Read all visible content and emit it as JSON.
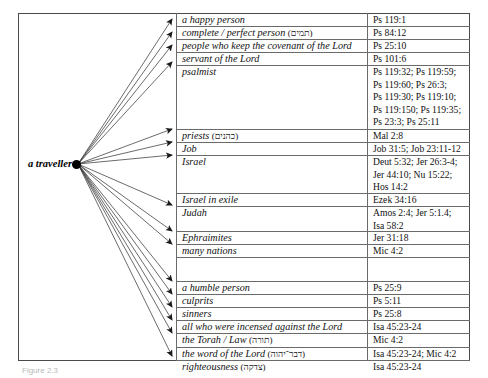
{
  "figure": {
    "hub_label": "a traveller",
    "caption": "Figure 2.3",
    "accent_color": "#000000",
    "border_color": "#4a4a4a",
    "grid_color": "#6a6a6a"
  },
  "rows": [
    {
      "label": "a happy person",
      "hebrew": "",
      "ref": "Ps 119:1",
      "y": 1,
      "h": 13,
      "arrow": true
    },
    {
      "label": "complete / perfect person",
      "hebrew": "(תמים)",
      "ref": "Ps 84:12",
      "y": 14,
      "h": 13,
      "arrow": true
    },
    {
      "label": "people who keep the covenant of the Lord",
      "hebrew": "",
      "ref": "Ps 25:10",
      "y": 27,
      "h": 13,
      "arrow": true
    },
    {
      "label": "servant of the Lord",
      "hebrew": "",
      "ref": "Ps 101:6",
      "y": 40,
      "h": 13,
      "arrow": false
    },
    {
      "label": "psalmist",
      "hebrew": "",
      "ref": "Ps 119:32; Ps 119:59;\nPs 119:60; Ps 26:3;\nPs 119:30; Ps 119:10;\nPs 119:150; Ps 119:35;\nPs 23:3; Ps 25:11",
      "y": 53,
      "h": 64,
      "arrow": true
    },
    {
      "label": "priests",
      "hebrew": "(כהנים)",
      "ref": "Mal 2:8",
      "y": 117,
      "h": 13,
      "arrow": true
    },
    {
      "label": "Job",
      "hebrew": "",
      "ref": "Job 31:5; Job 23:11-12",
      "y": 130,
      "h": 13,
      "arrow": true
    },
    {
      "label": "Israel",
      "hebrew": "",
      "ref": "Deut 5:32; Jer 26:3-4;\nJer 44:10; Nu 15:22;\nHos 14:2",
      "y": 143,
      "h": 38,
      "arrow": true
    },
    {
      "label": "Israel in exile",
      "hebrew": "",
      "ref": "Ezek 34:16",
      "y": 181,
      "h": 13,
      "arrow": false
    },
    {
      "label": "Judah",
      "hebrew": "",
      "ref": "Amos 2:4; Jer 5:1.4;\nIsa 58:2",
      "y": 194,
      "h": 25,
      "arrow": true
    },
    {
      "label": "Ephraimites",
      "hebrew": "",
      "ref": "Jer 31:18",
      "y": 219,
      "h": 13,
      "arrow": true
    },
    {
      "label": "many nations",
      "hebrew": "",
      "ref": "Mic 4:2",
      "y": 232,
      "h": 13,
      "arrow": true
    },
    {
      "label": "",
      "hebrew": "",
      "ref": "",
      "y": 245,
      "h": 24,
      "arrow": false
    },
    {
      "label": "a humble person",
      "hebrew": "",
      "ref": "Ps 25:9",
      "y": 269,
      "h": 13,
      "arrow": true
    },
    {
      "label": "culprits",
      "hebrew": "",
      "ref": "Ps 5:11",
      "y": 282,
      "h": 13,
      "arrow": true
    },
    {
      "label": "sinners",
      "hebrew": "",
      "ref": "Ps 25:8",
      "y": 295,
      "h": 13,
      "arrow": true
    },
    {
      "label": "all who were incensed against the Lord",
      "hebrew": "",
      "ref": "Isa 45:23-24",
      "y": 308,
      "h": 13,
      "arrow": true
    },
    {
      "label": "the Torah / Law",
      "hebrew": "(תורה)",
      "ref": "Mic 4:2",
      "y": 321,
      "h": 14,
      "arrow": true
    },
    {
      "label": "the word of the Lord",
      "hebrew": "(דבר־יהוה)",
      "ref": "Isa 45:23-24; Mic 4:2",
      "y": 335,
      "h": 13,
      "arrow": false
    },
    {
      "label": "righteousness",
      "hebrew": "(צדקה)",
      "ref": "Isa 45:23-24",
      "y": 348,
      "h": 0,
      "arrow": true
    }
  ]
}
